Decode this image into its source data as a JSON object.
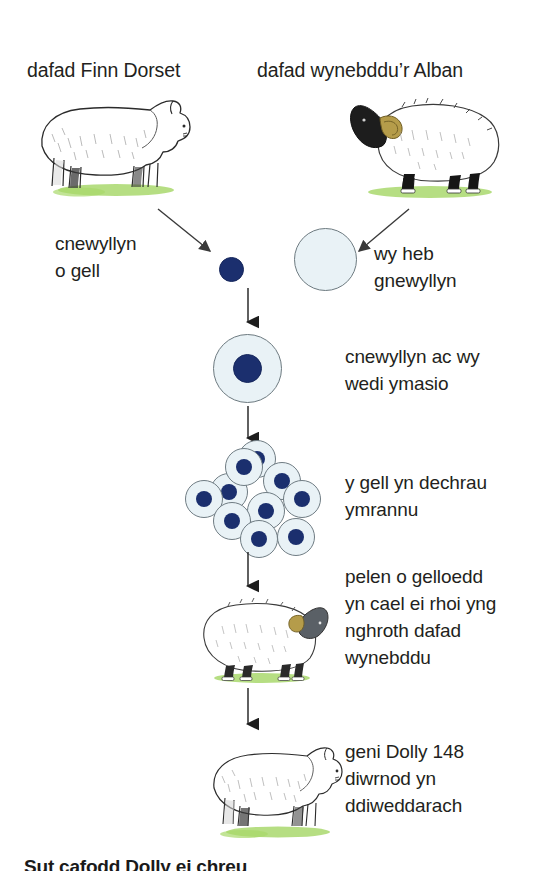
{
  "diagram": {
    "title_left": "dafad Finn Dorset",
    "title_right": "dafad wynebddu’r Alban",
    "labels": {
      "nucleus_from_cell": "cnewyllyn\no gell",
      "egg_without_nucleus": "wy heb\ngnewyllyn",
      "fused": "cnewyllyn ac wy\nwedi ymasio",
      "dividing": "y gell yn dechrau\nymrannu",
      "implanted": "pelen o gelloedd\nyn cael ei rhoi yng\nnghroth dafad\nwynebddu",
      "born": "geni Dolly 148\ndiwrnod yn\nddiweddarach"
    },
    "caption": "Sut cafodd Dolly ei chreu",
    "colors": {
      "nucleus": "#1b2f6e",
      "cytoplasm": "#e9f2f6",
      "cell_outline": "#6f7c83",
      "grass": "#8cc63f",
      "text": "#231f20"
    },
    "cluster_cell_count": 10
  }
}
